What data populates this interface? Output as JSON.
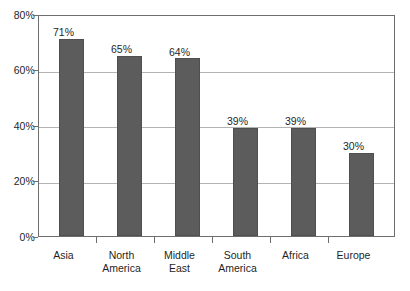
{
  "chart_data": {
    "type": "bar",
    "title": "",
    "subtitle": "",
    "xlabel": "",
    "ylabel": "",
    "categories": [
      "Asia",
      "North America",
      "Middle East",
      "South America",
      "Africa",
      "Europe"
    ],
    "values": [
      71,
      65,
      64,
      39,
      39,
      30
    ],
    "data_labels": [
      "71%",
      "65%",
      "64%",
      "39%",
      "39%",
      "30%"
    ],
    "ylim": [
      0,
      80
    ],
    "ytick_values": [
      0,
      20,
      40,
      60,
      80
    ],
    "ytick_labels": [
      "0%",
      "20%",
      "40%",
      "60%",
      "80%"
    ],
    "grid": true,
    "grid_axis": "y",
    "legend": false,
    "legend_position": "none",
    "series": [
      {
        "name": "",
        "values": [
          71,
          65,
          64,
          39,
          39,
          30
        ],
        "color": "#5c5c5c"
      }
    ],
    "annotations": []
  },
  "style": {
    "bar_color": "#5c5c5c",
    "bar_border_color": "#4f4f4f",
    "grid_color": "#b3b3b3",
    "axis_color": "#6e6e6e",
    "text_color": "#1f1f1f",
    "background": "#ffffff"
  }
}
